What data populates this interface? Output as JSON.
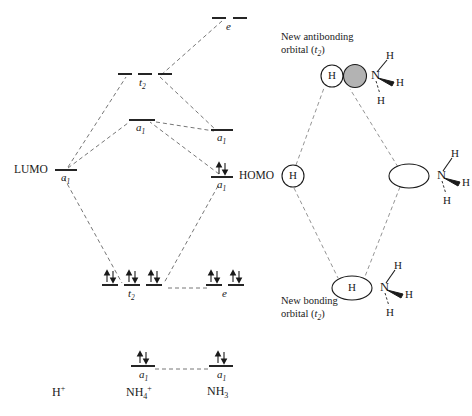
{
  "figure": {
    "type": "molecular-orbital-diagram",
    "background_color": "#ffffff",
    "line_color": "#555555",
    "text_color": "#1a1a1a",
    "orbital_fill_shaded": "#b3b3b3",
    "orbital_fill_empty": "#ffffff"
  },
  "left_diagram": {
    "columns": [
      {
        "id": "h-plus",
        "label": "H",
        "charge": "+",
        "x": 62
      },
      {
        "id": "nh4-plus",
        "label": "NH",
        "sub": "4",
        "charge": "+",
        "x": 143
      },
      {
        "id": "nh3",
        "label": "NH",
        "sub": "3",
        "charge": "",
        "x": 222
      }
    ],
    "species_labels": [
      {
        "name": "h-plus-label",
        "html": "H<sup>+</sup>",
        "x": 52,
        "y": 389
      },
      {
        "name": "nh4-plus-label",
        "html": "NH<sub>4</sub><sup>+</sup>",
        "x": 126,
        "y": 389
      },
      {
        "name": "nh3-label",
        "html": "NH<sub>3</sub>",
        "x": 208,
        "y": 389
      }
    ],
    "levels": [
      {
        "id": "nh3-e-antibonding",
        "term": "e",
        "term_sub": "",
        "electrons": 0,
        "dashes": 2,
        "side": "right",
        "x": 226,
        "y": 18,
        "dash_width": 14,
        "dash_gap": 9,
        "label_pos": "below"
      },
      {
        "id": "nh4-t2-antibonding",
        "term": "t",
        "term_sub": "2",
        "electrons": 0,
        "dashes": 3,
        "side": "center",
        "x": 142,
        "y": 74,
        "dash_width": 14,
        "dash_gap": 7,
        "label_pos": "below"
      },
      {
        "id": "nh4-a1-antibonding",
        "term": "a",
        "term_sub": "1",
        "electrons": 0,
        "dashes": 1,
        "side": "center",
        "x": 142,
        "y": 120,
        "dash_width": 26,
        "label_pos": "below"
      },
      {
        "id": "nh3-a1-lone-pair-level",
        "term": "a",
        "term_sub": "1",
        "electrons": 0,
        "dashes": 1,
        "side": "right",
        "x": 222,
        "y": 130,
        "dash_width": 22,
        "label_pos": "below"
      },
      {
        "id": "h-plus-a1-lumo",
        "term": "a",
        "term_sub": "1",
        "electrons": 0,
        "dashes": 1,
        "side": "left",
        "x": 62,
        "y": 170,
        "dash_width": 22,
        "label_pos": "below",
        "annotation": "LUMO"
      },
      {
        "id": "nh3-a1-homo",
        "term": "a",
        "term_sub": "1",
        "electrons": 2,
        "dashes": 1,
        "side": "right",
        "x": 222,
        "y": 177,
        "dash_width": 22,
        "label_pos": "below",
        "annotation": "HOMO"
      },
      {
        "id": "nh4-t2-bonding",
        "term": "t",
        "term_sub": "2",
        "electrons": 6,
        "dashes": 3,
        "side": "center",
        "x": 142,
        "y": 285,
        "dash_width": 16,
        "dash_gap": 6,
        "label_pos": "below"
      },
      {
        "id": "nh3-e-bonding",
        "term": "e",
        "term_sub": "",
        "electrons": 4,
        "dashes": 2,
        "side": "right",
        "x": 222,
        "y": 285,
        "dash_width": 16,
        "dash_gap": 7,
        "label_pos": "below"
      },
      {
        "id": "nh4-a1-core",
        "term": "a",
        "term_sub": "1",
        "electrons": 2,
        "dashes": 1,
        "side": "center",
        "x": 142,
        "y": 366,
        "dash_width": 24,
        "label_pos": "below"
      },
      {
        "id": "nh3-a1-core",
        "term": "a",
        "term_sub": "1",
        "electrons": 2,
        "dashes": 1,
        "side": "right",
        "x": 222,
        "y": 366,
        "dash_width": 24,
        "label_pos": "below"
      }
    ],
    "annotations": [
      {
        "name": "lumo-label",
        "text": "LUMO",
        "x": 14,
        "y": 166
      },
      {
        "name": "homo-label",
        "text": "HOMO",
        "x": 238,
        "y": 173
      }
    ],
    "correlation_lines": [
      {
        "from": "h-plus-a1-lumo",
        "to": "nh4-t2-antibonding"
      },
      {
        "from": "h-plus-a1-lumo",
        "to": "nh4-a1-antibonding"
      },
      {
        "from": "h-plus-a1-lumo",
        "to": "nh4-t2-bonding"
      },
      {
        "from": "nh3-e-antibonding",
        "to": "nh4-t2-antibonding"
      },
      {
        "from": "nh4-t2-antibonding",
        "to": "nh3-a1-lone-pair-level"
      },
      {
        "from": "nh4-a1-antibonding",
        "to": "nh3-a1-lone-pair-level"
      },
      {
        "from": "nh3-a1-homo",
        "to": "nh4-a1-antibonding"
      },
      {
        "from": "nh3-a1-homo",
        "to": "nh4-t2-bonding"
      },
      {
        "from": "nh4-t2-bonding",
        "to": "nh3-e-bonding"
      },
      {
        "from": "nh4-a1-core",
        "to": "nh3-a1-core"
      }
    ]
  },
  "right_diagram": {
    "captions": [
      {
        "id": "antibonding-caption",
        "line1": "New antibonding",
        "line2_prefix": "orbital (",
        "line2_term": "t",
        "line2_sub": "2",
        "line2_suffix": ")",
        "x": 281,
        "y": 32
      },
      {
        "id": "bonding-caption",
        "line1": "New bonding",
        "line2_prefix": "orbital (",
        "line2_term": "t",
        "line2_sub": "2",
        "line2_suffix": ")",
        "x": 281,
        "y": 296
      }
    ],
    "nodes": [
      {
        "id": "antibonding-node",
        "x": 332,
        "y": 76,
        "h_circle": {
          "label": "H",
          "fill": "#ffffff",
          "rx": 11,
          "ry": 11
        },
        "lobe": {
          "fill": "#b3b3b3",
          "rx": 11,
          "ry": 11,
          "present": true
        },
        "nitrogen": {
          "label": "N",
          "hydrogens": [
            "H",
            "H",
            "H"
          ]
        }
      },
      {
        "id": "reactant-h-node",
        "x": 293,
        "y": 176,
        "h_circle": {
          "label": "H",
          "fill": "#ffffff",
          "rx": 11,
          "ry": 11
        },
        "lobe": {
          "present": false
        },
        "nitrogen": null
      },
      {
        "id": "reactant-nh3-node",
        "x": 409,
        "y": 176,
        "h_circle": null,
        "lobe": {
          "fill": "#ffffff",
          "rx": 20,
          "ry": 12,
          "present": true
        },
        "nitrogen": {
          "label": "N",
          "hydrogens": [
            "H",
            "H",
            "H"
          ]
        }
      },
      {
        "id": "bonding-node",
        "x": 352,
        "y": 288,
        "h_circle": {
          "label": "H",
          "fill": "#ffffff",
          "rx": 20,
          "ry": 12
        },
        "lobe": {
          "present": false
        },
        "nitrogen": {
          "label": "N",
          "hydrogens": [
            "H",
            "H",
            "H"
          ]
        }
      }
    ],
    "connector_lines": [
      {
        "from": "reactant-h-node",
        "to": "antibonding-node"
      },
      {
        "from": "reactant-nh3-node",
        "to": "antibonding-node"
      },
      {
        "from": "reactant-h-node",
        "to": "bonding-node"
      },
      {
        "from": "reactant-nh3-node",
        "to": "bonding-node"
      }
    ]
  }
}
